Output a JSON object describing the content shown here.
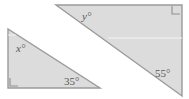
{
  "figure": {
    "background_color": "#ffffff",
    "fill_color": "#dcdcdc",
    "stroke_color": "#9a9a9a",
    "text_color": "#58585a",
    "highlight_line_color": "#f4f4f4"
  },
  "triangles": [
    {
      "id": "left-triangle",
      "name": "left-triangle",
      "points": "8,29 8,88 100,88",
      "right_angle_vertex": "bottom-left",
      "right_angle_mark": "10,78 10,86 18,86",
      "scan_line": {
        "x1": 8,
        "y1": 35,
        "x2": 16,
        "y2": 35
      },
      "labels": [
        {
          "id": "angle-x",
          "name": "angle-label-x",
          "text": "x°",
          "x": 16,
          "y": 52,
          "font_size": 11,
          "italic": true
        },
        {
          "id": "angle-35",
          "name": "angle-label-35",
          "text": "35°",
          "x": 64,
          "y": 85,
          "font_size": 11,
          "italic": false
        }
      ]
    },
    {
      "id": "right-triangle",
      "name": "right-triangle",
      "points": "56,5 182,5 182,96",
      "right_angle_vertex": "top-right",
      "right_angle_mark": "172,6 172,14 180,14",
      "scan_line": {
        "x1": 108,
        "y1": 38,
        "x2": 182,
        "y2": 38
      },
      "labels": [
        {
          "id": "angle-y",
          "name": "angle-label-y",
          "text": "y°",
          "x": 82,
          "y": 20,
          "font_size": 11,
          "italic": true
        },
        {
          "id": "angle-55",
          "name": "angle-label-55",
          "text": "55°",
          "x": 155,
          "y": 77,
          "font_size": 11,
          "italic": false
        }
      ]
    }
  ]
}
